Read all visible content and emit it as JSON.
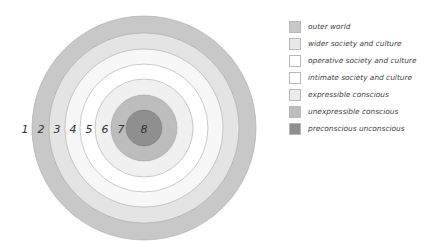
{
  "diagram": {
    "center": [
      144,
      128
    ],
    "rings": [
      {
        "number": "1",
        "radius": 112,
        "fill": "#c8c8c8",
        "label_x": 12
      },
      {
        "number": "2",
        "radius": 95,
        "fill": "#e4e4e4",
        "label_x": 42
      },
      {
        "number": "3",
        "radius": 79,
        "fill": "#f6f6f6",
        "label_x": 57
      },
      {
        "number": "4",
        "radius": 64,
        "fill": "#ffffff",
        "label_x": 73
      },
      {
        "number": "5",
        "radius": 49,
        "fill": "#f0f0f0",
        "label_x": 89
      },
      {
        "number": "6",
        "radius": 34,
        "fill": "#e6e6e6",
        "label_x": 105
      },
      {
        "number": "7",
        "radius": 18,
        "fill": "#c0c0c0",
        "label_x": 121
      },
      {
        "number": "8",
        "radius": 0,
        "fill": "#8f8f8f",
        "label_x": 144
      }
    ],
    "ring_labels": [
      "1",
      "2",
      "3",
      "4",
      "5",
      "6",
      "7",
      "8"
    ]
  },
  "legend": {
    "items": [
      {
        "label": "outer world",
        "color": "#c8c8c8"
      },
      {
        "label": "wider society and culture",
        "color": "#e4e4e4"
      },
      {
        "label": "operative society and culture",
        "color": "#ffffff"
      },
      {
        "label": "intimate society and culture",
        "color": "#ffffff"
      },
      {
        "label": "expressible conscious",
        "color": "#e8e8e8"
      },
      {
        "label": "unexpressible conscious",
        "color": "#bdbdbd"
      },
      {
        "label": "preconscious unconscious",
        "color": "#8f8f8f"
      }
    ]
  }
}
